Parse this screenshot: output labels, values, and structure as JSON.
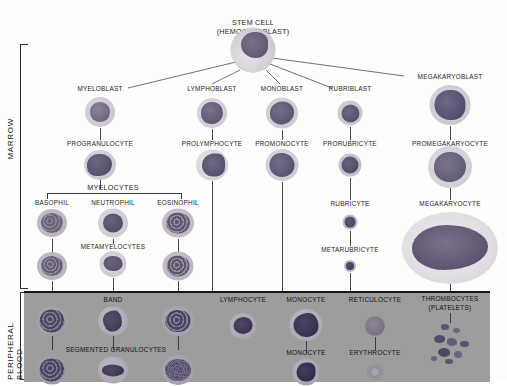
{
  "diagram": {
    "compartments": [
      {
        "id": "marrow",
        "label": "MARROW"
      },
      {
        "id": "peripheral",
        "label": "PERIPHERAL BLOOD"
      }
    ],
    "root": {
      "label": "STEM CELL",
      "sublabel": "(HEMOCYTOBLAST)"
    },
    "bracket_labels": [
      {
        "id": "myelocytes",
        "label": "MYELOCYTES"
      },
      {
        "id": "metamyelocytes",
        "label": "METAMYELOCYTES"
      },
      {
        "id": "segmented",
        "label": "SEGMENTED GRANULOCYTES"
      }
    ],
    "lineages": [
      {
        "id": "granulocytic",
        "stages": [
          "MYELOBLAST",
          "PROGRANULOCYTE"
        ],
        "subtypes": [
          "BASOPHIL",
          "NEUTROPHIL",
          "EOSINOPHIL"
        ],
        "blood": [
          "BAND"
        ]
      },
      {
        "id": "lymphocytic",
        "stages": [
          "LYMPHOBLAST",
          "PROLYMPHOCYTE"
        ],
        "blood": [
          "LYMPHOCYTE"
        ]
      },
      {
        "id": "monocytic",
        "stages": [
          "MONOBLAST",
          "PROMONOCYTE"
        ],
        "blood": [
          "MONOCYTE",
          "MONOCYTE"
        ]
      },
      {
        "id": "erythrocytic",
        "stages": [
          "RUBRIBLAST",
          "PRORUBRICYTE",
          "RUBRICYTE",
          "METARUBRICYTE"
        ],
        "blood": [
          "RETICULOCYTE",
          "ERYTHROCYTE"
        ]
      },
      {
        "id": "thrombocytic",
        "stages": [
          "MEGAKARYOBLAST",
          "PROMEGAKARYOCYTE",
          "MEGAKARYOCYTE"
        ],
        "blood": [
          "THROMBOCYTES\n(PLATELETS)"
        ]
      }
    ],
    "colors": {
      "panel_background": "#9d9d9b",
      "page_background": "#fdfdfc",
      "line": "#4a4a4a",
      "text": "#1c1c1c",
      "nucleus_dark": "#55506a",
      "nucleus_mid": "#6e6880",
      "cytoplasm": "#d8d5dd"
    }
  }
}
